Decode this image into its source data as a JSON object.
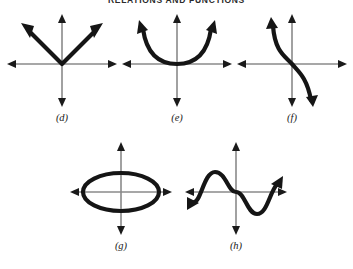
{
  "page": {
    "title": "RELATIONS AND FUNCTIONS",
    "background_color": "#ffffff",
    "axis_color": "#8a8a8a",
    "curve_color": "#151515",
    "label_color": "#1a1a1a"
  },
  "graphs": [
    {
      "id": "d",
      "label": "(d)",
      "curve_name": "absolute-value-v-shape",
      "description": "V-shaped absolute value graph with vertex at the origin, both branches ending in arrowheads pointing up-left and up-right",
      "arrowheads": [
        "upper-left",
        "upper-right"
      ],
      "passes_through_origin": true,
      "is_function": true
    },
    {
      "id": "e",
      "label": "(e)",
      "curve_name": "upward-parabola",
      "description": "Parabola opening upward with vertex at the origin, arrowheads at upper-left and upper-right",
      "arrowheads": [
        "upper-left",
        "upper-right"
      ],
      "passes_through_origin": true,
      "is_function": true
    },
    {
      "id": "f",
      "label": "(f)",
      "curve_name": "decreasing-cubic",
      "description": "Decreasing cubic-like curve through the origin, arrowhead at upper-left and lower-right",
      "arrowheads": [
        "upper-left",
        "lower-right"
      ],
      "passes_through_origin": true,
      "is_function": true
    },
    {
      "id": "g",
      "label": "(g)",
      "curve_name": "horizontal-ellipse",
      "description": "Closed horizontal ellipse centered at the origin, wider than it is tall",
      "arrowheads": [],
      "passes_through_origin": false,
      "is_function": false
    },
    {
      "id": "h",
      "label": "(h)",
      "curve_name": "sine-wave",
      "description": "Sine-like wave with a crest left of the y-axis, crossing at the origin, a trough to the right, then rising; arrowheads at lower-left and upper-right",
      "arrowheads": [
        "lower-left",
        "upper-right"
      ],
      "passes_through_origin": true,
      "is_function": true
    }
  ],
  "axes": {
    "x_arrow_left": "left-arrowhead",
    "x_arrow_right": "right-arrowhead",
    "y_arrow_up": "up-arrowhead",
    "y_arrow_down": "down-arrowhead"
  }
}
